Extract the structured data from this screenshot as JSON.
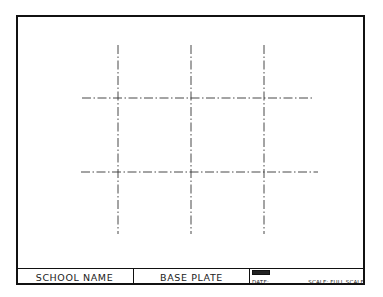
{
  "drawing": {
    "type": "technical-drawing",
    "description": "Base plate layout with centerlines",
    "centerlines": {
      "style": "dash-dot",
      "vertical_count": 3,
      "horizontal_count": 2
    },
    "line_color": "#333333",
    "border_color": "#111111"
  },
  "title_block": {
    "school_name": "SCHOOL NAME",
    "part_name": "BASE PLATE",
    "date_label": "DATE:",
    "date_value": "",
    "scale_label": "SCALE: FULL SCALE"
  }
}
